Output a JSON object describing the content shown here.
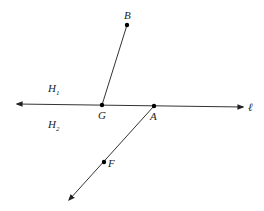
{
  "diagram": {
    "type": "geometry-figure",
    "line": {
      "label": "ℓ",
      "from": [
        17,
        104
      ],
      "to": [
        243,
        107
      ],
      "arrows": "both"
    },
    "half_planes": [
      {
        "label": "H",
        "subscript": "1",
        "position": [
          50,
          90
        ]
      },
      {
        "label": "H",
        "subscript": "2",
        "position": [
          50,
          127
        ]
      }
    ],
    "points": [
      {
        "name": "B",
        "x": 127,
        "y": 25,
        "label_pos": [
          124,
          18
        ]
      },
      {
        "name": "G",
        "x": 102,
        "y": 105,
        "label_pos": [
          98,
          118
        ]
      },
      {
        "name": "A",
        "x": 154,
        "y": 106,
        "label_pos": [
          150,
          119
        ]
      },
      {
        "name": "F",
        "x": 104,
        "y": 162,
        "label_pos": [
          108,
          166
        ]
      }
    ],
    "segments": [
      {
        "name": "segment-GB",
        "from": "G",
        "to": "B"
      }
    ],
    "rays": [
      {
        "name": "ray-AF",
        "from": "A",
        "through": "F",
        "end": [
          69,
          200
        ]
      }
    ],
    "stroke_color": "#333333",
    "point_color": "#000000"
  }
}
